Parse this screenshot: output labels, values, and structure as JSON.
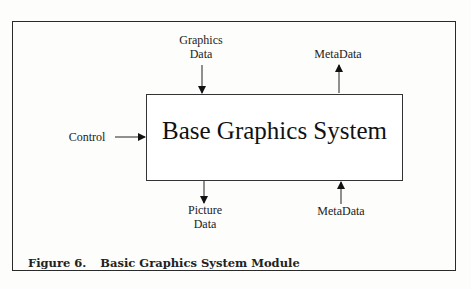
{
  "diagram": {
    "title_box": "Base Graphics System",
    "inputs": [
      {
        "id": "graphics-data",
        "label_lines": [
          "Graphics",
          "Data"
        ],
        "direction": "down-into-box-top"
      },
      {
        "id": "control",
        "label_lines": [
          "Control"
        ],
        "direction": "right-into-box-left"
      },
      {
        "id": "metadata-in",
        "label_lines": [
          "MetaData"
        ],
        "direction": "up-into-box-bottom"
      }
    ],
    "outputs": [
      {
        "id": "metadata-out",
        "label_lines": [
          "MetaData"
        ],
        "direction": "up-out-of-box-top"
      },
      {
        "id": "picture-data",
        "label_lines": [
          "Picture",
          "Data"
        ],
        "direction": "down-out-of-box-bottom"
      }
    ]
  },
  "caption": {
    "number": "Figure 6.",
    "text": "Basic Graphics System Module"
  }
}
